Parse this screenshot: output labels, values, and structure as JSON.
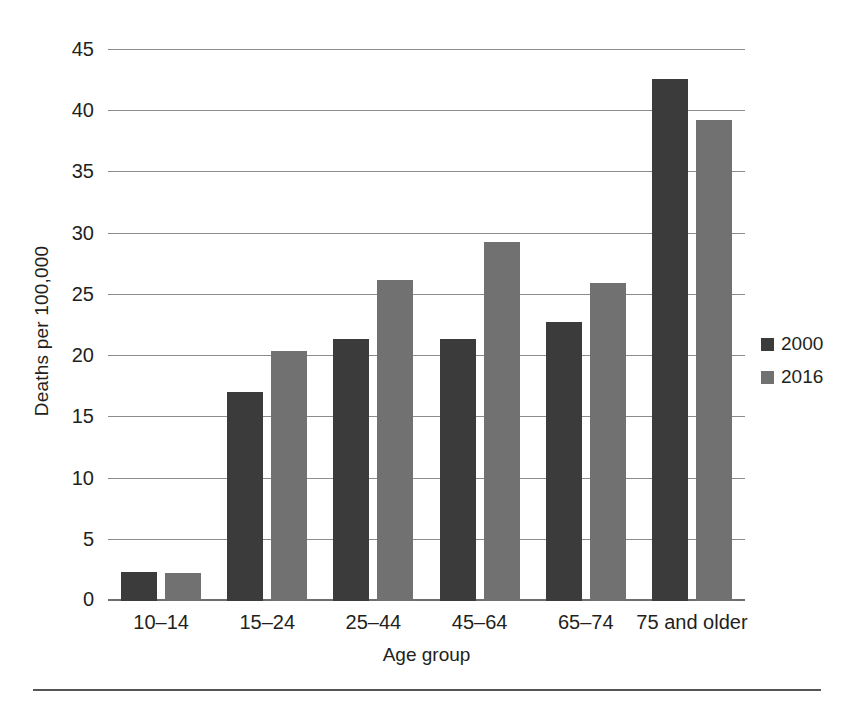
{
  "chart_data": {
    "type": "bar",
    "title": "",
    "xlabel": "Age group",
    "ylabel": "Deaths per 100,000",
    "categories": [
      "10–14",
      "15–24",
      "25–44",
      "45–64",
      "65–74",
      "75 and older"
    ],
    "series": [
      {
        "name": "2000",
        "color": "#3b3b3b",
        "values": [
          2.4,
          17.1,
          21.4,
          21.4,
          22.8,
          42.6
        ]
      },
      {
        "name": "2016",
        "color": "#717171",
        "values": [
          2.3,
          20.4,
          26.2,
          29.3,
          26.0,
          39.3
        ]
      }
    ],
    "ylim": [
      0,
      45
    ],
    "yticks": [
      0,
      5,
      10,
      15,
      20,
      25,
      30,
      35,
      40,
      45
    ],
    "ytick_labels": [
      "0",
      "5",
      "10",
      "15",
      "20",
      "25",
      "30",
      "35",
      "40",
      "45"
    ],
    "grid": "horizontal",
    "legend_position": "right",
    "legend_entries": [
      "2000",
      "2016"
    ],
    "annotations": []
  }
}
